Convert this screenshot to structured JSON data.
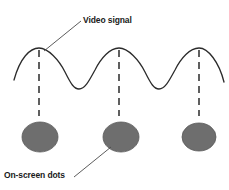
{
  "diagram": {
    "title_label": "Video signal",
    "dots_label": "On-screen dots",
    "colors": {
      "background": "#ffffff",
      "wave_stroke": "#2b2b2b",
      "dash_stroke": "#2b2b2b",
      "dot_fill": "#6e6e6e",
      "dot_stroke": "#5a5a5a",
      "leader_stroke": "#4a4a4a",
      "text": "#1a1a1a"
    },
    "wave": {
      "name": "video-signal-waveform",
      "peaks_x": [
        39,
        119,
        199
      ],
      "troughs_x": [
        79,
        159
      ],
      "peak_y": 48,
      "trough_y": 89,
      "start_x": 14,
      "start_y": 80,
      "end_x": 224,
      "end_y": 82,
      "path": "M 14,80 C 20,58 30,48 39,48 C 48,48 59,60 65,72 C 71,84 74,89 79,89 C 85,89 89,81 95,70 C 101,58 110,48 119,48 C 128,48 139,60 145,72 C 151,84 154,89 159,89 C 165,89 169,81 175,70 C 181,58 190,48 199,48 C 208,48 219,62 224,82"
    },
    "dashed_lines": [
      {
        "name": "dash-line-1",
        "x": 39,
        "y1": 50,
        "y2": 116
      },
      {
        "name": "dash-line-2",
        "x": 119,
        "y1": 50,
        "y2": 116
      },
      {
        "name": "dash-line-3",
        "x": 199,
        "y1": 50,
        "y2": 116
      }
    ],
    "dots": [
      {
        "name": "on-screen-dot-1",
        "cx": 40,
        "cy": 137,
        "rx": 18,
        "ry": 15
      },
      {
        "name": "on-screen-dot-2",
        "cx": 121,
        "cy": 137,
        "rx": 18,
        "ry": 15
      },
      {
        "name": "on-screen-dot-3",
        "cx": 199,
        "cy": 137,
        "rx": 17,
        "ry": 14
      }
    ],
    "leaders": [
      {
        "name": "leader-video-signal",
        "x1": 44,
        "y1": 51,
        "x2": 81,
        "y2": 21
      },
      {
        "name": "leader-onscreen-dots",
        "x1": 74,
        "y1": 177,
        "x2": 111,
        "y2": 147
      }
    ]
  }
}
